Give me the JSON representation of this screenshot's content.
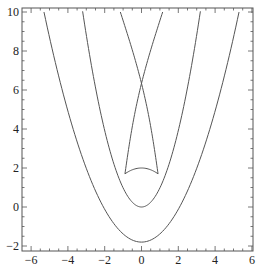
{
  "chart_data": {
    "type": "line",
    "title": "",
    "xlabel": "",
    "ylabel": "",
    "xlim": [
      -6.5,
      6.1
    ],
    "ylim": [
      -2.2,
      10.2
    ],
    "grid": false,
    "legend": null,
    "x_ticks": [
      -6,
      -4,
      -2,
      0,
      2,
      4,
      6
    ],
    "x_tick_labels": [
      "−6",
      "−4",
      "−2",
      "0",
      "2",
      "4",
      "6"
    ],
    "y_ticks": [
      -2,
      0,
      2,
      4,
      6,
      8,
      10
    ],
    "y_tick_labels": [
      "−2",
      "0",
      "2",
      "4",
      "6",
      "8",
      "10"
    ],
    "line_color": "#555555",
    "series": [
      {
        "name": "outer-parabola",
        "description": "wide parabola, vertex at (0, -1.8)",
        "points": [
          [
            -5.3,
            10
          ],
          [
            -4,
            4.9
          ],
          [
            -3,
            2.0
          ],
          [
            -2,
            -0.1
          ],
          [
            -1,
            -1.3
          ],
          [
            0,
            -1.8
          ],
          [
            1,
            -1.3
          ],
          [
            2,
            -0.1
          ],
          [
            3,
            2.0
          ],
          [
            4,
            4.9
          ],
          [
            5.3,
            10
          ]
        ]
      },
      {
        "name": "inner-parabola",
        "description": "narrower parabola, vertex at (0, 0)",
        "points": [
          [
            -3.2,
            10
          ],
          [
            -2.5,
            6.2
          ],
          [
            -2,
            4.0
          ],
          [
            -1.5,
            2.2
          ],
          [
            -1,
            1.0
          ],
          [
            -0.5,
            0.25
          ],
          [
            0,
            0
          ],
          [
            0.5,
            0.25
          ],
          [
            1,
            1.0
          ],
          [
            1.5,
            2.2
          ],
          [
            2,
            4.0
          ],
          [
            2.5,
            6.2
          ],
          [
            3.2,
            10
          ]
        ]
      },
      {
        "name": "swallowtail-left-branch",
        "description": "line from top-left, through crossing at (0,4.3), to right cusp (0.9,1.7)",
        "points": [
          [
            -1.15,
            10
          ],
          [
            -0.6,
            7.1
          ],
          [
            0,
            4.3
          ],
          [
            0.5,
            2.9
          ],
          [
            0.9,
            1.7
          ]
        ]
      },
      {
        "name": "swallowtail-right-branch",
        "description": "line from top-right, through crossing at (0,4.3), to left cusp (-0.9,1.7)",
        "points": [
          [
            1.15,
            10
          ],
          [
            0.6,
            7.1
          ],
          [
            0,
            4.3
          ],
          [
            -0.5,
            2.9
          ],
          [
            -0.9,
            1.7
          ]
        ]
      },
      {
        "name": "swallowtail-bottom-arc",
        "description": "arc joining the two cusps, peaked at (0, 2.0)",
        "points": [
          [
            -0.9,
            1.7
          ],
          [
            -0.5,
            1.93
          ],
          [
            0,
            2.0
          ],
          [
            0.5,
            1.93
          ],
          [
            0.9,
            1.7
          ]
        ]
      }
    ]
  }
}
